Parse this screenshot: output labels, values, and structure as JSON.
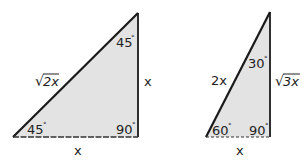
{
  "triangles": [
    {
      "name": "45-45-90 triangle",
      "angles": {
        "bottom_left": "45",
        "top": "45",
        "right_angle": "90"
      },
      "degree_symbol": "°",
      "sides": {
        "hypotenuse": "2x",
        "hypotenuse_radical": "√",
        "vertical_leg": "x",
        "base": "x"
      }
    },
    {
      "name": "30-60-90 triangle",
      "angles": {
        "bottom_left": "60",
        "top": "30",
        "right_angle": "90"
      },
      "degree_symbol": "°",
      "sides": {
        "hypotenuse": "2x",
        "vertical_leg": "3x",
        "vertical_leg_radical": "√",
        "base": "x"
      }
    }
  ],
  "colors": {
    "fill": "#e3e3e3",
    "stroke": "#1a1a1a",
    "text": "#222222"
  }
}
